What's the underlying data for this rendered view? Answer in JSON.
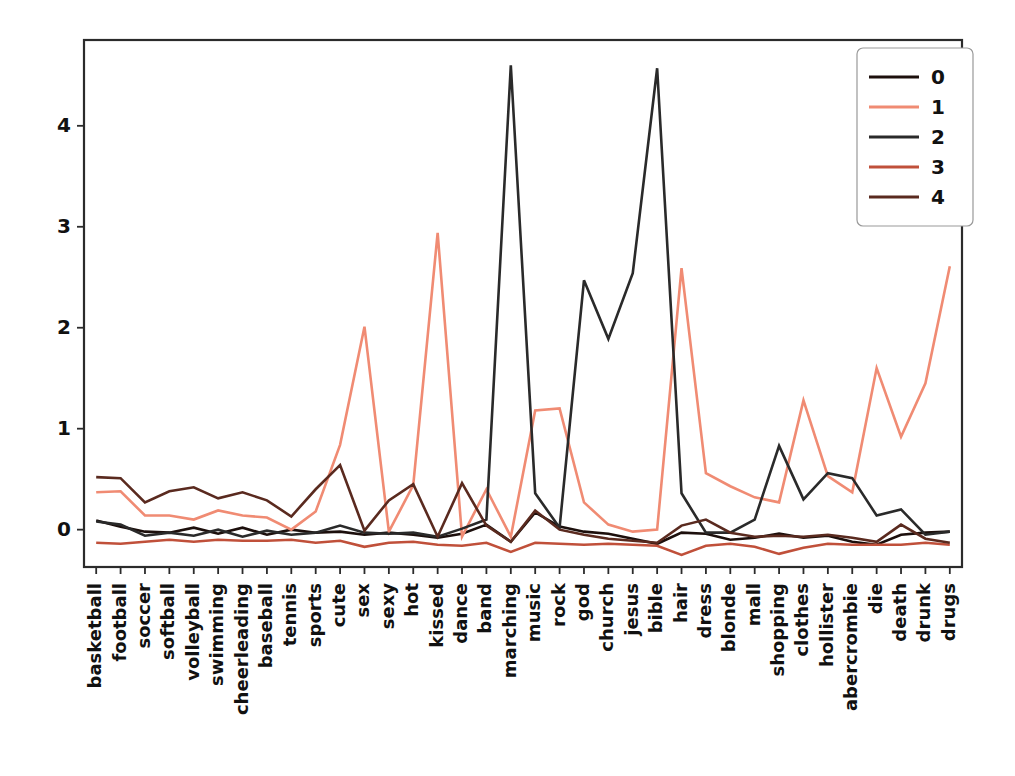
{
  "chart_data": {
    "type": "line",
    "title": "",
    "xlabel": "",
    "ylabel": "",
    "ylim": [
      -0.37,
      4.85
    ],
    "yticks": [
      0,
      1,
      2,
      3,
      4
    ],
    "grid": false,
    "legend_position": "upper right",
    "legend_title": "",
    "categories": [
      "basketball",
      "football",
      "soccer",
      "softball",
      "volleyball",
      "swimming",
      "cheerleading",
      "baseball",
      "tennis",
      "sports",
      "cute",
      "sex",
      "sexy",
      "hot",
      "kissed",
      "dance",
      "band",
      "marching",
      "music",
      "rock",
      "god",
      "church",
      "jesus",
      "bible",
      "hair",
      "dress",
      "blonde",
      "mall",
      "shopping",
      "clothes",
      "hollister",
      "abercrombie",
      "die",
      "death",
      "drunk",
      "drugs"
    ],
    "series": [
      {
        "name": "0",
        "color": "#1c0f0c",
        "values": [
          0.09,
          0.03,
          -0.02,
          -0.03,
          0.02,
          -0.04,
          0.02,
          -0.05,
          0.0,
          -0.03,
          -0.02,
          -0.05,
          -0.03,
          -0.05,
          -0.08,
          -0.04,
          0.05,
          -0.12,
          0.17,
          0.03,
          -0.02,
          -0.04,
          -0.09,
          -0.14,
          -0.03,
          -0.04,
          -0.1,
          -0.08,
          -0.04,
          -0.08,
          -0.06,
          -0.12,
          -0.15,
          -0.05,
          -0.03,
          -0.02
        ]
      },
      {
        "name": "1",
        "color": "#f08b73",
        "values": [
          0.37,
          0.38,
          0.14,
          0.14,
          0.1,
          0.19,
          0.14,
          0.12,
          0.0,
          0.18,
          0.84,
          2.01,
          -0.02,
          0.44,
          2.94,
          -0.07,
          0.4,
          -0.07,
          1.18,
          1.2,
          0.27,
          0.05,
          -0.02,
          0.0,
          2.59,
          0.56,
          0.43,
          0.32,
          0.27,
          1.28,
          0.53,
          0.37,
          1.6,
          0.92,
          1.45,
          2.61
        ]
      },
      {
        "name": "2",
        "color": "#2a2a2a",
        "values": [
          0.08,
          0.05,
          -0.06,
          -0.03,
          -0.06,
          0.0,
          -0.07,
          -0.01,
          -0.05,
          -0.03,
          0.04,
          -0.03,
          -0.04,
          -0.03,
          -0.07,
          0.01,
          0.1,
          4.6,
          0.36,
          0.02,
          2.47,
          1.89,
          2.54,
          4.57,
          0.36,
          -0.03,
          -0.03,
          0.1,
          0.83,
          0.3,
          0.56,
          0.51,
          0.14,
          0.2,
          -0.05,
          -0.02
        ]
      },
      {
        "name": "3",
        "color": "#c0503a",
        "values": [
          -0.13,
          -0.14,
          -0.12,
          -0.1,
          -0.12,
          -0.1,
          -0.11,
          -0.11,
          -0.1,
          -0.13,
          -0.11,
          -0.17,
          -0.13,
          -0.12,
          -0.15,
          -0.16,
          -0.13,
          -0.22,
          -0.13,
          -0.14,
          -0.15,
          -0.14,
          -0.15,
          -0.16,
          -0.25,
          -0.16,
          -0.14,
          -0.17,
          -0.24,
          -0.18,
          -0.14,
          -0.15,
          -0.15,
          -0.15,
          -0.13,
          -0.15
        ]
      },
      {
        "name": "4",
        "color": "#5a2a1f",
        "values": [
          0.52,
          0.51,
          0.27,
          0.38,
          0.42,
          0.31,
          0.37,
          0.29,
          0.13,
          0.4,
          0.64,
          -0.01,
          0.29,
          0.45,
          -0.07,
          0.46,
          0.04,
          -0.12,
          0.19,
          0.0,
          -0.05,
          -0.09,
          -0.11,
          -0.13,
          0.04,
          0.1,
          -0.03,
          -0.07,
          -0.06,
          -0.07,
          -0.05,
          -0.08,
          -0.12,
          0.05,
          -0.09,
          -0.13
        ]
      }
    ]
  },
  "axes": {
    "ytick_labels": [
      "0",
      "1",
      "2",
      "3",
      "4"
    ]
  },
  "legend": {
    "entries": [
      {
        "label": "0",
        "color": "#1c0f0c"
      },
      {
        "label": "1",
        "color": "#f08b73"
      },
      {
        "label": "2",
        "color": "#2a2a2a"
      },
      {
        "label": "3",
        "color": "#c0503a"
      },
      {
        "label": "4",
        "color": "#5a2a1f"
      }
    ]
  }
}
